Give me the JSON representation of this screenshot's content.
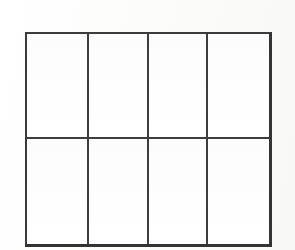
{
  "document": {
    "kind": "scanned-blank-grid-table",
    "background_color": "#fdfdfc",
    "line_color": "#3d3d3d",
    "cell_fill_color": "#ffffff"
  },
  "table": {
    "name": "blank-grid-table",
    "columns": 4,
    "rows": 2,
    "has_header_row": false,
    "column_headers": [
      "",
      "",
      "",
      ""
    ],
    "cells": [
      [
        "",
        "",
        "",
        ""
      ],
      [
        "",
        "",
        "",
        ""
      ]
    ]
  }
}
